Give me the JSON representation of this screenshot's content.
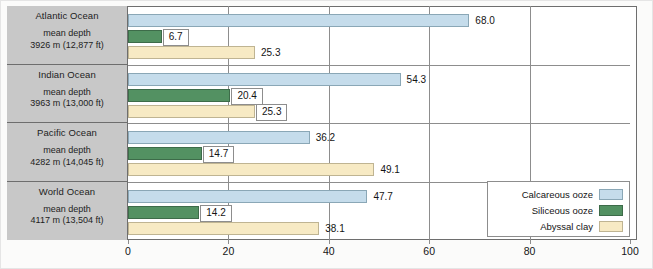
{
  "chart_data": {
    "type": "bar",
    "orientation": "horizontal",
    "title": "",
    "xlabel": "",
    "ylabel": "",
    "xlim": [
      0,
      100
    ],
    "xticks": [
      0,
      20,
      40,
      60,
      80,
      100
    ],
    "grid": true,
    "legend_position": "bottom-right",
    "categories": [
      "Atlantic Ocean",
      "Indian Ocean",
      "Pacific Ocean",
      "World Ocean"
    ],
    "series": [
      {
        "name": "Calcareous ooze",
        "color": "#c5dceb",
        "values": [
          68.0,
          54.3,
          36.2,
          47.7
        ]
      },
      {
        "name": "Siliceous ooze",
        "color": "#539162",
        "values": [
          6.7,
          20.4,
          14.7,
          14.2
        ]
      },
      {
        "name": "Abyssal clay",
        "color": "#f7eac4",
        "values": [
          25.3,
          25.3,
          49.1,
          38.1
        ]
      }
    ],
    "annotations": [
      "3926 m (12,877 ft)",
      "3963 m (13,000 ft)",
      "4282 m (14,045 ft)",
      "4117 m (13,504 ft)"
    ]
  },
  "groups": [
    {
      "ocean": "Atlantic Ocean",
      "depth_label": "mean depth",
      "depth_value": "3926 m (12,877 ft)",
      "bars": [
        {
          "series": "Calcareous ooze",
          "value": 68.0,
          "label": "68.0",
          "style": "plain"
        },
        {
          "series": "Siliceous ooze",
          "value": 6.7,
          "label": "6.7",
          "style": "boxed"
        },
        {
          "series": "Abyssal clay",
          "value": 25.3,
          "label": "25.3",
          "style": "plain"
        }
      ]
    },
    {
      "ocean": "Indian Ocean",
      "depth_label": "mean depth",
      "depth_value": "3963 m (13,000 ft)",
      "bars": [
        {
          "series": "Calcareous ooze",
          "value": 54.3,
          "label": "54.3",
          "style": "plain"
        },
        {
          "series": "Siliceous ooze",
          "value": 20.4,
          "label": "20.4",
          "style": "boxed"
        },
        {
          "series": "Abyssal clay",
          "value": 25.3,
          "label": "25.3",
          "style": "boxed"
        }
      ]
    },
    {
      "ocean": "Pacific Ocean",
      "depth_label": "mean depth",
      "depth_value": "4282 m (14,045 ft)",
      "bars": [
        {
          "series": "Calcareous ooze",
          "value": 36.2,
          "label": "36.2",
          "style": "plain"
        },
        {
          "series": "Siliceous ooze",
          "value": 14.7,
          "label": "14.7",
          "style": "boxed"
        },
        {
          "series": "Abyssal clay",
          "value": 49.1,
          "label": "49.1",
          "style": "plain"
        }
      ]
    },
    {
      "ocean": "World Ocean",
      "depth_label": "mean depth",
      "depth_value": "4117 m (13,504 ft)",
      "bars": [
        {
          "series": "Calcareous ooze",
          "value": 47.7,
          "label": "47.7",
          "style": "plain"
        },
        {
          "series": "Siliceous ooze",
          "value": 14.2,
          "label": "14.2",
          "style": "boxed"
        },
        {
          "series": "Abyssal clay",
          "value": 38.1,
          "label": "38.1",
          "style": "plain"
        }
      ]
    }
  ],
  "axis": {
    "ticks": [
      "0",
      "20",
      "40",
      "60",
      "80",
      "100"
    ]
  },
  "legend": {
    "items": [
      {
        "label": "Calcareous ooze",
        "swatch": "calc"
      },
      {
        "label": "Siliceous ooze",
        "swatch": "sil"
      },
      {
        "label": "Abyssal clay",
        "swatch": "clay"
      }
    ]
  },
  "caption": {
    "text": ""
  }
}
